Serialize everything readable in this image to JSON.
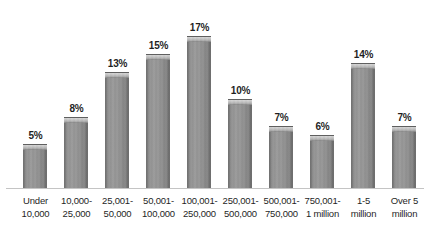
{
  "chart_data": {
    "type": "bar",
    "title": "",
    "subtitle": "",
    "xlabel": "",
    "ylabel": "",
    "ylim": [
      0,
      18
    ],
    "grid": false,
    "legend": false,
    "value_suffix": "%",
    "categories": [
      "Under 10,000",
      "10,000-25,000",
      "25,001-50,000",
      "50,001-100,000",
      "100,001-250,000",
      "250,001-500,000",
      "500,001-750,000",
      "750,001-1 million",
      "1-5 million",
      "Over 5 million"
    ],
    "category_lines": [
      [
        "Under",
        "10,000"
      ],
      [
        "10,000-",
        "25,000"
      ],
      [
        "25,001-",
        "50,000"
      ],
      [
        "50,001-",
        "100,000"
      ],
      [
        "100,001-",
        "250,000"
      ],
      [
        "250,001-",
        "500,000"
      ],
      [
        "500,001-",
        "750,000"
      ],
      [
        "750,001-",
        "1 million"
      ],
      [
        "1-5",
        "million"
      ],
      [
        "Over 5",
        "million"
      ]
    ],
    "values": [
      5,
      8,
      13,
      15,
      17,
      10,
      7,
      6,
      14,
      7
    ],
    "data_labels": [
      "5%",
      "8%",
      "13%",
      "15%",
      "17%",
      "10%",
      "7%",
      "6%",
      "14%",
      "7%"
    ],
    "colors": {
      "bar_fill": "#949494",
      "bar_edge": "#6b6b6b",
      "bar_cap": "#c2c2c2",
      "axis_line": "#c4c4c4",
      "text": "#1f1f1f",
      "background": "#ffffff"
    }
  }
}
